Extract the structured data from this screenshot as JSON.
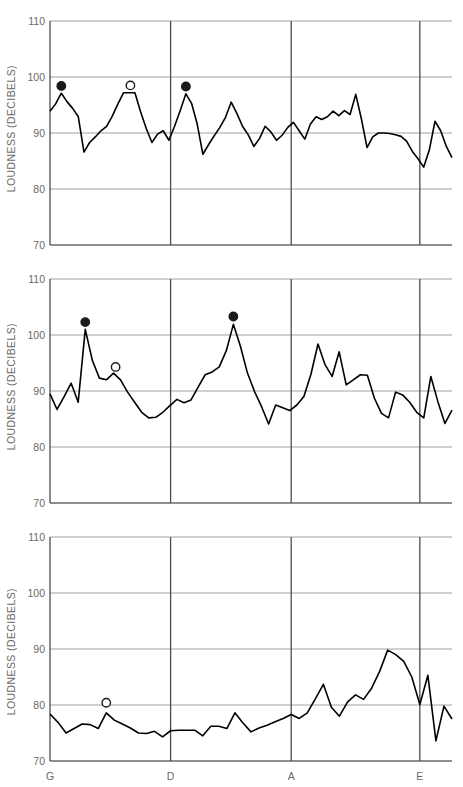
{
  "figure": {
    "axis_label_y": "LOUDNESS (DECIBELS)",
    "y_ticks": [
      110,
      100,
      90,
      80,
      70
    ],
    "x_ticks": [
      "G",
      "D",
      "A",
      "E"
    ],
    "ylim": [
      70,
      110
    ],
    "colors": {
      "line": "#000000",
      "grid": "#8c8c8c",
      "axis": "#4d4d4d",
      "text": "#6a6a6a",
      "marker_filled": "#1a1a1a",
      "marker_open": "#ffffff"
    }
  },
  "chart_data": [
    {
      "type": "line",
      "panel": 1,
      "title": "",
      "xlabel": "",
      "ylabel": "LOUDNESS (DECIBELS)",
      "ylim": [
        70,
        110
      ],
      "grid": true,
      "yticks": [
        70,
        80,
        90,
        100,
        110
      ],
      "xticks": [
        {
          "label": "G",
          "x": 0
        },
        {
          "label": "D",
          "x": 15
        },
        {
          "label": "A",
          "x": 30
        },
        {
          "label": "E",
          "x": 46
        }
      ],
      "x": [
        0,
        1,
        2,
        3,
        4,
        5,
        6,
        7,
        8,
        9,
        10,
        11,
        12,
        13,
        14,
        15,
        16,
        17,
        18,
        19,
        20,
        21,
        22,
        23,
        24,
        25,
        26,
        27,
        28,
        29,
        30,
        31,
        32,
        33,
        34,
        35,
        36,
        37,
        38,
        39,
        40,
        41,
        42,
        43,
        44,
        45,
        46,
        47,
        48,
        49,
        50,
        51,
        52,
        53,
        54,
        55,
        56,
        57,
        58,
        59,
        60,
        61,
        62,
        63,
        64,
        65,
        66,
        67,
        68,
        69,
        70,
        71,
        72,
        73,
        74,
        75,
        76,
        77,
        78,
        79,
        80,
        81,
        82,
        83,
        84,
        85,
        86,
        87,
        88,
        89,
        90
      ],
      "values": [
        93.9,
        95.2,
        97.1,
        95.6,
        94.4,
        92.9,
        86.6,
        88.3,
        89.3,
        90.4,
        91.2,
        93.0,
        95.2,
        97.2,
        97.2,
        97.2,
        93.8,
        90.8,
        88.3,
        89.8,
        90.4,
        88.7,
        91.2,
        94.0,
        97.0,
        95.3,
        91.6,
        86.2,
        87.9,
        89.5,
        91.0,
        92.8,
        95.5,
        93.5,
        91.2,
        89.7,
        87.6,
        89.0,
        91.2,
        90.2,
        88.7,
        89.6,
        91.0,
        91.9,
        90.4,
        88.9,
        91.6,
        92.9,
        92.4,
        92.9,
        93.9,
        93.1,
        94.0,
        93.3,
        96.9,
        92.5,
        87.4,
        89.3,
        90.0,
        90.0,
        89.9,
        89.7,
        89.4,
        88.5,
        86.7,
        85.4,
        83.9,
        87.0,
        92.1,
        90.4,
        87.6,
        85.6
      ],
      "markers": [
        {
          "x": 2,
          "y": 98.4,
          "style": "filled"
        },
        {
          "x": 14.2,
          "y": 98.5,
          "style": "open"
        },
        {
          "x": 24,
          "y": 98.3,
          "style": "filled"
        }
      ]
    },
    {
      "type": "line",
      "panel": 2,
      "title": "",
      "xlabel": "",
      "ylabel": "LOUDNESS (DECIBELS)",
      "ylim": [
        70,
        110
      ],
      "grid": true,
      "yticks": [
        70,
        80,
        90,
        100,
        110
      ],
      "xticks": [
        {
          "label": "G",
          "x": 0
        },
        {
          "label": "D",
          "x": 15
        },
        {
          "label": "A",
          "x": 30
        },
        {
          "label": "E",
          "x": 46
        }
      ],
      "x": [
        0,
        1,
        2,
        3,
        4,
        5,
        6,
        7,
        8,
        9,
        10,
        11,
        12,
        13,
        14,
        15,
        16,
        17,
        18,
        19,
        20,
        21,
        22,
        23,
        24,
        25,
        26,
        27,
        28,
        29,
        30,
        31,
        32,
        33,
        34,
        35,
        36,
        37,
        38,
        39,
        40,
        41,
        42,
        43,
        44,
        45,
        46,
        47,
        48,
        49,
        50,
        51,
        52,
        53,
        54,
        55,
        56,
        57,
        58,
        59,
        60,
        61,
        62,
        63,
        64,
        65,
        66,
        67,
        68,
        69,
        70,
        71
      ],
      "values": [
        89.5,
        86.7,
        89.0,
        91.4,
        88.0,
        101.0,
        95.5,
        92.3,
        92.0,
        93.2,
        92.0,
        89.8,
        88.0,
        86.2,
        85.2,
        85.3,
        86.2,
        87.4,
        88.5,
        87.9,
        88.4,
        90.7,
        92.9,
        93.4,
        94.3,
        97.2,
        101.9,
        98.0,
        93.2,
        89.9,
        87.2,
        84.1,
        87.5,
        87.0,
        86.5,
        87.5,
        89.0,
        93.0,
        98.4,
        94.7,
        92.6,
        97.0,
        91.1,
        92.0,
        92.9,
        92.8,
        88.7,
        86.0,
        85.2,
        89.8,
        89.3,
        88.0,
        86.2,
        85.2,
        92.6,
        88.1,
        84.2,
        86.6
      ],
      "markers": [
        {
          "x": 5,
          "y": 102.3,
          "style": "filled"
        },
        {
          "x": 9.3,
          "y": 94.3,
          "style": "open"
        },
        {
          "x": 26,
          "y": 103.3,
          "style": "filled"
        }
      ]
    },
    {
      "type": "line",
      "panel": 3,
      "title": "",
      "xlabel": "",
      "ylabel": "LOUDNESS (DECIBELS)",
      "ylim": [
        70,
        110
      ],
      "grid": true,
      "yticks": [
        70,
        80,
        90,
        100,
        110
      ],
      "xticks": [
        {
          "label": "G",
          "x": 0
        },
        {
          "label": "D",
          "x": 15
        },
        {
          "label": "A",
          "x": 30
        },
        {
          "label": "E",
          "x": 46
        }
      ],
      "x": [
        0,
        1,
        2,
        3,
        4,
        5,
        6,
        7,
        8,
        9,
        10,
        11,
        12,
        13,
        14,
        15,
        16,
        17,
        18,
        19,
        20,
        21,
        22,
        23,
        24,
        25,
        26,
        27,
        28,
        29,
        30,
        31,
        32,
        33,
        34,
        35,
        36,
        37,
        38,
        39,
        40,
        41,
        42,
        43,
        44,
        45,
        46,
        47,
        48,
        49,
        50,
        51,
        52,
        53,
        54,
        55,
        56,
        57,
        58,
        59,
        60,
        61,
        62,
        63,
        64,
        65,
        66,
        67,
        68,
        69,
        70,
        71,
        72
      ],
      "values": [
        78.4,
        76.9,
        75.0,
        75.8,
        76.6,
        76.5,
        75.8,
        78.6,
        77.3,
        76.6,
        75.9,
        75.0,
        74.9,
        75.3,
        74.3,
        75.4,
        75.5,
        75.5,
        75.5,
        74.5,
        76.2,
        76.2,
        75.8,
        78.6,
        76.8,
        75.2,
        75.9,
        76.4,
        77.0,
        77.6,
        78.3,
        77.6,
        78.6,
        81.1,
        83.7,
        79.6,
        78.0,
        80.5,
        81.8,
        81.0,
        83.0,
        86.0,
        89.8,
        89.0,
        87.8,
        85.0,
        80.1,
        85.3,
        73.6,
        79.8,
        77.5
      ],
      "markers": [
        {
          "x": 7,
          "y": 80.4,
          "style": "open"
        }
      ]
    }
  ]
}
